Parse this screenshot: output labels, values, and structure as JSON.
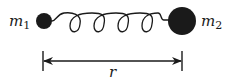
{
  "diagram": {
    "type": "two masses connected by a spring",
    "mass_1": {
      "label_base": "m",
      "label_sub": "1",
      "radius": 8,
      "color": "#1a1a1a"
    },
    "mass_2": {
      "label_base": "m",
      "label_sub": "2",
      "radius": 14,
      "color": "#1a1a1a"
    },
    "spring": {
      "coils": 4,
      "color": "#1a1a1a"
    },
    "separation": {
      "label": "r",
      "style": "double-headed arrow with end ticks"
    }
  }
}
